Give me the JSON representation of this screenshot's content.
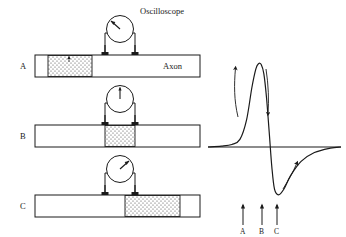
{
  "figure": {
    "title_text": "",
    "panels": [
      {
        "id": "A",
        "label": "A",
        "instrument_label": "Oscilloscope",
        "axon_label": "Axon",
        "needle_direction": "up-right",
        "depolarized_region": "left"
      },
      {
        "id": "B",
        "label": "B",
        "instrument_label": "",
        "axon_label": "",
        "needle_direction": "up",
        "depolarized_region": "center"
      },
      {
        "id": "C",
        "label": "C",
        "instrument_label": "",
        "axon_label": "",
        "needle_direction": "up-right",
        "depolarized_region": "right"
      }
    ],
    "graph": {
      "marker_labels": [
        "A",
        "B",
        "C"
      ],
      "axis_label_x": "",
      "axis_label_y": "",
      "rising_arrow": "up",
      "falling_arrow": "down",
      "recovery_arrow": "up-right"
    }
  },
  "chart_data": {
    "type": "line",
    "title": "",
    "xlabel": "",
    "ylabel": "",
    "grid": false,
    "legend": "none",
    "xlim": [
      0,
      100
    ],
    "ylim": [
      -45,
      100
    ],
    "baseline": 0,
    "annotations": [
      {
        "label": "A",
        "x": 27,
        "note": "resting / rising foot"
      },
      {
        "label": "B",
        "x": 45,
        "note": "repolarization crossing"
      },
      {
        "label": "C",
        "x": 58,
        "note": "hyperpolarization"
      }
    ],
    "series": [
      {
        "name": "Action potential",
        "x": [
          0,
          10,
          18,
          24,
          29,
          33,
          36,
          38,
          40,
          42,
          44,
          46,
          48,
          50,
          53,
          57,
          62,
          70,
          80,
          92,
          100
        ],
        "values": [
          0,
          1,
          3,
          9,
          32,
          70,
          92,
          98,
          97,
          86,
          58,
          18,
          -18,
          -38,
          -43,
          -38,
          -26,
          -13,
          -5,
          -1,
          0
        ]
      }
    ]
  },
  "colors": {
    "ink": "#1a1a1a",
    "fill_white": "#ffffff",
    "stipple": "#4a4a4a"
  }
}
